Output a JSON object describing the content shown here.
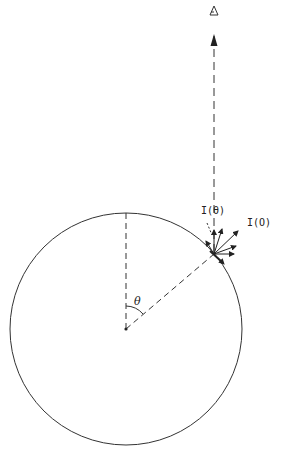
{
  "diagram": {
    "type": "limb-darkening geometry",
    "labels": {
      "intensity_theta": "I(θ)",
      "intensity_zero": "I(O)",
      "angle": "θ",
      "observer_symbol": "⍋"
    },
    "colors": {
      "line": "#222222",
      "background": "#ffffff"
    }
  }
}
